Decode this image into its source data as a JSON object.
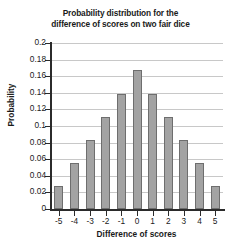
{
  "chart_data": {
    "type": "bar",
    "title": "Probability distribution for the difference of scores on two fair dice",
    "title_lines": [
      "Probability distribution for the",
      "difference of scores on two fair dice"
    ],
    "xlabel": "Difference of scores",
    "ylabel": "Probability",
    "categories": [
      "-5",
      "-4",
      "-3",
      "-2",
      "-1",
      "0",
      "1",
      "2",
      "3",
      "4",
      "5"
    ],
    "values": [
      0.028,
      0.056,
      0.083,
      0.111,
      0.139,
      0.167,
      0.139,
      0.111,
      0.083,
      0.056,
      0.028
    ],
    "ylim": [
      0,
      0.2
    ],
    "ytick_labels": [
      "0",
      "0.02",
      "0.04",
      "0.06",
      "0.08",
      "0.1",
      "0.12",
      "0.14",
      "0.16",
      "0.18",
      "0.2"
    ],
    "ytick_values": [
      0,
      0.02,
      0.04,
      0.06,
      0.08,
      0.1,
      0.12,
      0.14,
      0.16,
      0.18,
      0.2
    ],
    "grid": true,
    "legend": "none",
    "bar_color": "#a3a3a3",
    "bar_border_color": "#6e6e6e",
    "gridline_color": "#c8c8c8",
    "axis_color": "#2b2b2b",
    "text_color": "#1a1a1a",
    "background_color": "#ffffff"
  }
}
